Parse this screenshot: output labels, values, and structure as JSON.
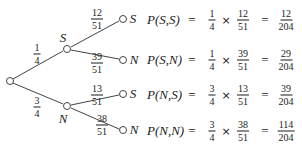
{
  "tree": {
    "first_level": [
      {
        "outcome": "S",
        "prob_num": "1",
        "prob_den": "4"
      },
      {
        "outcome": "N",
        "prob_num": "3",
        "prob_den": "4"
      }
    ],
    "second_level": [
      {
        "parent": "S",
        "outcome": "S",
        "prob_num": "12",
        "prob_den": "51"
      },
      {
        "parent": "S",
        "outcome": "N",
        "prob_num": "39",
        "prob_den": "51"
      },
      {
        "parent": "N",
        "outcome": "S",
        "prob_num": "13",
        "prob_den": "51"
      },
      {
        "parent": "N",
        "outcome": "N",
        "prob_num": "38",
        "prob_den": "51"
      }
    ]
  },
  "equations": [
    {
      "label": "P(S,S)",
      "eq": "=",
      "a_num": "1",
      "a_den": "4",
      "times": "×",
      "b_num": "12",
      "b_den": "51",
      "eq2": "=",
      "r_num": "12",
      "r_den": "204"
    },
    {
      "label": "P(S,N)",
      "eq": "=",
      "a_num": "1",
      "a_den": "4",
      "times": "×",
      "b_num": "39",
      "b_den": "51",
      "eq2": "=",
      "r_num": "29",
      "r_den": "204"
    },
    {
      "label": "P(N,S)",
      "eq": "=",
      "a_num": "3",
      "a_den": "4",
      "times": "×",
      "b_num": "13",
      "b_den": "51",
      "eq2": "=",
      "r_num": "39",
      "r_den": "204"
    },
    {
      "label": "P(N,N)",
      "eq": "=",
      "a_num": "3",
      "a_den": "4",
      "times": "×",
      "b_num": "38",
      "b_den": "51",
      "eq2": "=",
      "r_num": "114",
      "r_den": "204"
    }
  ]
}
